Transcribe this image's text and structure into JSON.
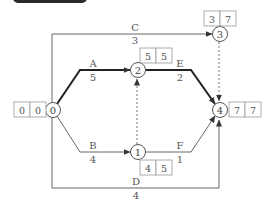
{
  "header": {
    "label": "",
    "text": ""
  },
  "nodes": [
    {
      "id": "0",
      "label": "0",
      "es": "0",
      "lf": "0"
    },
    {
      "id": "1",
      "label": "1",
      "es": "4",
      "lf": "5"
    },
    {
      "id": "2",
      "label": "2",
      "es": "5",
      "lf": "5"
    },
    {
      "id": "3",
      "label": "3",
      "es": "3",
      "lf": "7"
    },
    {
      "id": "4",
      "label": "4",
      "es": "7",
      "lf": "7"
    }
  ],
  "activities": [
    {
      "name": "A",
      "duration": "5",
      "from": "0",
      "to": "2",
      "critical": true
    },
    {
      "name": "B",
      "duration": "4",
      "from": "0",
      "to": "1",
      "critical": false
    },
    {
      "name": "C",
      "duration": "3",
      "from": "0",
      "to": "3",
      "critical": false
    },
    {
      "name": "D",
      "duration": "4",
      "from": "0",
      "to": "4",
      "critical": false
    },
    {
      "name": "E",
      "duration": "2",
      "from": "2",
      "to": "4",
      "critical": true
    },
    {
      "name": "F",
      "duration": "1",
      "from": "1",
      "to": "4",
      "critical": false
    }
  ],
  "dummies": [
    {
      "from": "1",
      "to": "2"
    },
    {
      "from": "3",
      "to": "4"
    }
  ],
  "colors": {
    "line": "#666666",
    "critical": "#222222",
    "box_border": "#999999"
  }
}
